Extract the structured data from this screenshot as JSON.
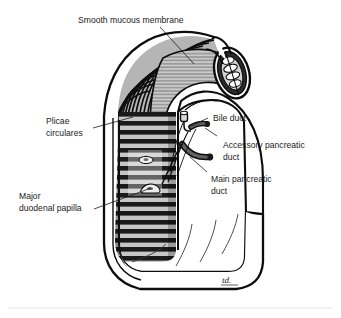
{
  "figure": {
    "signature": "td.",
    "background_color": "#ffffff",
    "ink_color": "#1a1a1a",
    "mucosa_fill": "#c8c8c8",
    "fold_fill": "#8f8f8f",
    "wall_fill": "#ffffff",
    "duct_fill": "#4a4a4a",
    "divider_color": "#e4e4e4"
  },
  "labels": {
    "smooth_mucous_membrane": {
      "line1": "Smooth mucous membrane"
    },
    "plicae_circulares": {
      "line1": "Plicae",
      "line2": "circulares"
    },
    "major_duodenal_papilla": {
      "line1": "Major",
      "line2": "duodenal papilla"
    },
    "bile_duct": {
      "line1": "Bile duct"
    },
    "accessory_pancreatic_duct": {
      "line1": "Accessory pancreatic",
      "line2": "duct"
    },
    "main_pancreatic_duct": {
      "line1": "Main pancreatic",
      "line2": "duct"
    }
  }
}
